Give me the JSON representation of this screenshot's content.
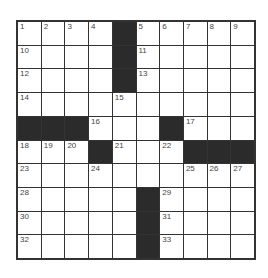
{
  "puzzle": {
    "rows": 10,
    "cols": 10,
    "grid": [
      [
        "1",
        "2",
        "3",
        "4",
        "#",
        "5",
        "6",
        "7",
        "8",
        "9"
      ],
      [
        "10",
        "",
        "",
        "",
        "#",
        "11",
        "",
        "",
        "",
        ""
      ],
      [
        "12",
        "",
        "",
        "",
        "#",
        "13",
        "",
        "",
        "",
        ""
      ],
      [
        "14",
        "",
        "",
        "",
        "15",
        "",
        "",
        "",
        "",
        ""
      ],
      [
        "#",
        "#",
        "#",
        "16",
        "",
        "",
        "#",
        "17",
        "",
        ""
      ],
      [
        "18",
        "19",
        "20",
        "#",
        "21",
        "",
        "22",
        "#",
        "#",
        "#"
      ],
      [
        "23",
        "",
        "",
        "24",
        "",
        "",
        "",
        "25",
        "26",
        "27"
      ],
      [
        "28",
        "",
        "",
        "",
        "",
        "#",
        "29",
        "",
        "",
        ""
      ],
      [
        "30",
        "",
        "",
        "",
        "",
        "#",
        "31",
        "",
        "",
        ""
      ],
      [
        "32",
        "",
        "",
        "",
        "",
        "#",
        "33",
        "",
        "",
        ""
      ]
    ]
  },
  "colors": {
    "block": "#2b2b2b",
    "border": "#333333",
    "cell": "#ffffff"
  }
}
